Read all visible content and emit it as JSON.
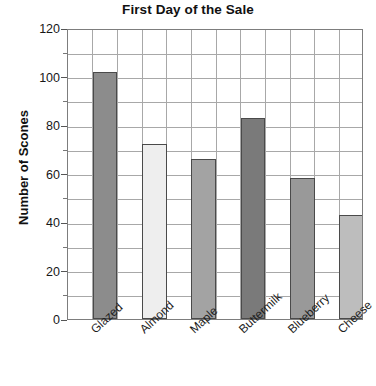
{
  "chart_data": {
    "type": "bar",
    "title": "First Day of the Sale",
    "xlabel": "",
    "ylabel": "Number of Scones",
    "categories": [
      "Glazed",
      "Almond",
      "Maple",
      "Buttermilk",
      "Blueberry",
      "Cheese"
    ],
    "values": [
      102,
      72,
      66,
      83,
      58,
      43
    ],
    "ylim": [
      0,
      120
    ],
    "ytick_labels": [
      "0",
      "20",
      "40",
      "60",
      "80",
      "100",
      "120"
    ],
    "ytick_values": [
      0,
      20,
      40,
      60,
      80,
      100,
      120
    ],
    "minor_tick_interval": 10,
    "grid": true,
    "legend": "none",
    "bar_colors": [
      "#8c8c8c",
      "#eeeeee",
      "#a3a3a3",
      "#7a7a7a",
      "#999999",
      "#bdbdbd"
    ],
    "bar_edge_color": "#4a4a4a",
    "grid_color": "#a8a8a8",
    "axis_color": "#7d7d7d",
    "background_color": "#ffffff"
  }
}
